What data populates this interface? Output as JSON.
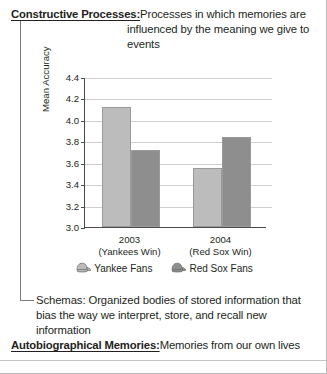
{
  "definitions": {
    "constructive": {
      "term": "Constructive Processes:",
      "body": "Processes in which memories are influenced by the meaning we give to events"
    },
    "schemas": {
      "text": "Schemas: Organized bodies of stored information that bias the way we interpret, store, and recall new information"
    },
    "autobiographical": {
      "term": "Autobiographical Memories:",
      "definition": "Memories from our own lives"
    }
  },
  "chart_data": {
    "type": "bar",
    "title": "",
    "xlabel": "",
    "ylabel": "Mean Accuracy",
    "ylim": [
      3.0,
      4.4
    ],
    "ytick_labels": [
      "3.0",
      "3.2",
      "3.4",
      "3.6",
      "3.8",
      "4.0",
      "4.2",
      "4.4"
    ],
    "ytick_values": [
      3.0,
      3.2,
      3.4,
      3.6,
      3.8,
      4.0,
      4.2,
      4.4
    ],
    "grid": true,
    "legend_position": "bottom",
    "categories": [
      "2003",
      "2004"
    ],
    "category_sublabels": [
      "(Yankees Win)",
      "(Red Sox Win)"
    ],
    "series": [
      {
        "name": "Yankee Fans",
        "color": "#bcbcbc",
        "icon": "baseball-cap-icon",
        "values": [
          4.12,
          3.55
        ]
      },
      {
        "name": "Red Sox Fans",
        "color": "#8e8e8e",
        "icon": "baseball-cap-icon",
        "values": [
          3.72,
          3.84
        ]
      }
    ]
  }
}
